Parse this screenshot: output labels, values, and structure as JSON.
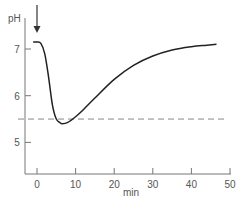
{
  "chart_data": {
    "type": "line",
    "title": "",
    "xlabel": "min",
    "ylabel": "pH",
    "xlim": [
      -3,
      50
    ],
    "ylim": [
      4.2,
      7.6
    ],
    "x_ticks": [
      0,
      10,
      20,
      30,
      40,
      50
    ],
    "x_tick_labels": [
      "0",
      "10",
      "20",
      "30",
      "40",
      "50"
    ],
    "y_ticks": [
      5,
      6,
      7
    ],
    "y_tick_labels": [
      "5",
      "6",
      "7"
    ],
    "grid": false,
    "legend": null,
    "series": [
      {
        "name": "pH",
        "x": [
          -1,
          0,
          1,
          2,
          3,
          4,
          5,
          6,
          6.5,
          8,
          10,
          12,
          15,
          20,
          25,
          30,
          35,
          40,
          44,
          46.5
        ],
        "values": [
          7.15,
          7.15,
          7.12,
          6.9,
          6.4,
          5.8,
          5.5,
          5.42,
          5.4,
          5.43,
          5.55,
          5.7,
          5.95,
          6.35,
          6.65,
          6.85,
          6.98,
          7.05,
          7.08,
          7.1
        ]
      }
    ],
    "reference_line": {
      "orientation": "horizontal",
      "y": 5.5,
      "style": "dashed",
      "x_range": [
        -3,
        48
      ]
    },
    "annotations": [
      {
        "type": "arrow",
        "x": 0,
        "direction": "down",
        "meaning": "addition point at t=0"
      }
    ]
  },
  "axis": {
    "y_label": "pH",
    "x_label": "min"
  }
}
